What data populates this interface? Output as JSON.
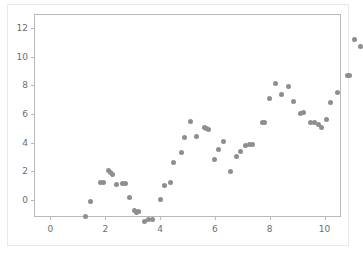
{
  "chart_data": {
    "type": "scatter",
    "title": "",
    "xlabel": "",
    "ylabel": "",
    "xlim": [
      -0.6,
      10.6
    ],
    "ylim": [
      -1.2,
      13.0
    ],
    "xticks": [
      0,
      2,
      4,
      6,
      8,
      10
    ],
    "yticks": [
      0,
      2,
      4,
      6,
      8,
      10,
      12
    ],
    "xtick_labels": [
      "0",
      "2",
      "4",
      "6",
      "8",
      "10"
    ],
    "ytick_labels": [
      "0",
      "2",
      "4",
      "6",
      "8",
      "10",
      "12"
    ],
    "grid": false,
    "legend": null,
    "marker_color": "#8e8e8e",
    "marker_size": 5,
    "series": [
      {
        "name": "data",
        "points": [
          [
            0.0,
            -0.15
          ],
          [
            0.2,
            0.95
          ],
          [
            0.55,
            2.25
          ],
          [
            0.65,
            2.25
          ],
          [
            0.85,
            3.1
          ],
          [
            0.92,
            2.95
          ],
          [
            1.0,
            2.85
          ],
          [
            1.15,
            2.15
          ],
          [
            1.35,
            2.2
          ],
          [
            1.45,
            2.2
          ],
          [
            1.6,
            1.2
          ],
          [
            1.8,
            0.3
          ],
          [
            1.85,
            0.15
          ],
          [
            1.95,
            0.2
          ],
          [
            2.15,
            -0.45
          ],
          [
            2.3,
            -0.3
          ],
          [
            2.45,
            -0.3
          ],
          [
            2.75,
            1.05
          ],
          [
            2.9,
            2.05
          ],
          [
            3.1,
            2.25
          ],
          [
            3.2,
            3.65
          ],
          [
            3.5,
            4.35
          ],
          [
            3.6,
            5.4
          ],
          [
            3.85,
            6.55
          ],
          [
            4.05,
            5.45
          ],
          [
            4.35,
            6.1
          ],
          [
            4.4,
            6.05
          ],
          [
            4.5,
            5.95
          ],
          [
            4.7,
            3.85
          ],
          [
            4.85,
            4.55
          ],
          [
            5.05,
            5.1
          ],
          [
            5.3,
            3.0
          ],
          [
            5.5,
            4.1
          ],
          [
            5.65,
            4.45
          ],
          [
            5.85,
            4.85
          ],
          [
            6.0,
            4.9
          ],
          [
            6.1,
            4.9
          ],
          [
            6.45,
            6.45
          ],
          [
            6.55,
            6.45
          ],
          [
            6.7,
            8.15
          ],
          [
            6.95,
            9.2
          ],
          [
            7.15,
            8.45
          ],
          [
            7.4,
            9.0
          ],
          [
            7.6,
            7.95
          ],
          [
            7.85,
            7.1
          ],
          [
            7.95,
            7.15
          ],
          [
            8.2,
            6.45
          ],
          [
            8.35,
            6.45
          ],
          [
            8.5,
            6.3
          ],
          [
            8.6,
            6.1
          ],
          [
            8.8,
            6.7
          ],
          [
            8.95,
            7.85
          ],
          [
            9.2,
            8.55
          ],
          [
            9.55,
            9.75
          ],
          [
            9.65,
            9.75
          ],
          [
            9.8,
            12.25
          ],
          [
            10.05,
            11.8
          ]
        ]
      }
    ]
  }
}
